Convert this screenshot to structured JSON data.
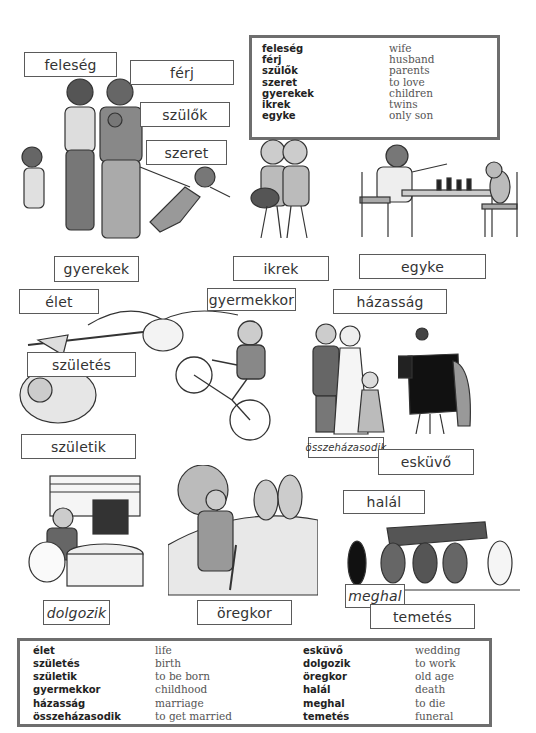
{
  "top_vocabulary": {
    "rows": [
      {
        "hu": "feleség",
        "en": "wife"
      },
      {
        "hu": "férj",
        "en": "husband"
      },
      {
        "hu": "szülők",
        "en": "parents"
      },
      {
        "hu": "szeret",
        "en": "to love"
      },
      {
        "hu": "gyerekek",
        "en": "children"
      },
      {
        "hu": "ikrek",
        "en": "twins"
      },
      {
        "hu": "egyke",
        "en": "only son"
      }
    ]
  },
  "labels": {
    "feleseg": "feleség",
    "ferj": "férj",
    "szulok": "szülők",
    "szeret": "szeret",
    "gyerekek": "gyerekek",
    "ikrek": "ikrek",
    "egyke": "egyke",
    "elet": "élet",
    "gyermekkor": "gyermekkor",
    "hazassag": "házasság",
    "szuletes": "születés",
    "szuletik": "születik",
    "osszehazasodik": "összeházasodik",
    "eskuvo": "esküvő",
    "halal": "halál",
    "dolgozik": "dolgozik",
    "oregkor": "öregkor",
    "meghal": "meghal",
    "temetes": "temetés"
  },
  "illustrations": {
    "family": "family-illustration",
    "twins": "twins-illustration",
    "chess": "boy-playing-chess-with-cat",
    "stork": "stork-carrying-baby",
    "bike": "boy-on-bicycle",
    "wedding": "wedding-couple",
    "photographer": "wedding-photographer",
    "office": "man-at-computer",
    "old_man": "old-man-with-cane",
    "funeral": "funeral-procession"
  },
  "bottom_vocabulary": {
    "left": [
      {
        "hu": "élet",
        "en": "life"
      },
      {
        "hu": "születés",
        "en": "birth"
      },
      {
        "hu": "születik",
        "en": "to be born"
      },
      {
        "hu": "gyermekkor",
        "en": "childhood"
      },
      {
        "hu": "házasság",
        "en": "marriage"
      },
      {
        "hu": "összeházasodik",
        "en": "to get married"
      }
    ],
    "right": [
      {
        "hu": "esküvő",
        "en": "wedding"
      },
      {
        "hu": "dolgozik",
        "en": "to work"
      },
      {
        "hu": "öregkor",
        "en": "old age"
      },
      {
        "hu": "halál",
        "en": "death"
      },
      {
        "hu": "meghal",
        "en": "to die"
      },
      {
        "hu": "temetés",
        "en": "funeral"
      }
    ]
  }
}
